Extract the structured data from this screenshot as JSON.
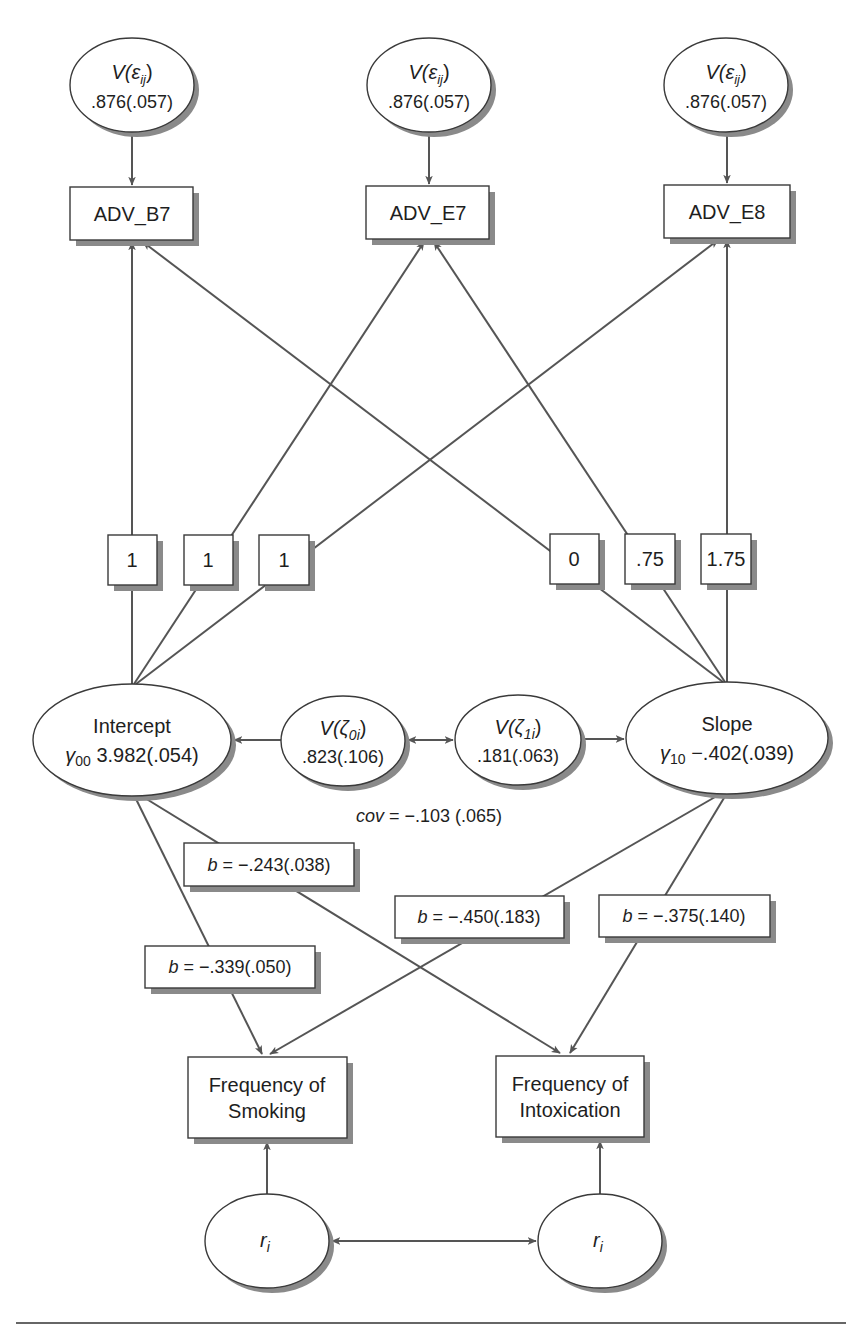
{
  "diagram": {
    "error_variances": [
      {
        "label": "V(ε",
        "sub": "ij",
        "close": ")",
        "value": ".876(.057)"
      },
      {
        "label": "V(ε",
        "sub": "ij",
        "close": ")",
        "value": ".876(.057)"
      },
      {
        "label": "V(ε",
        "sub": "ij",
        "close": ")",
        "value": ".876(.057)"
      }
    ],
    "indicators": [
      "ADV_B7",
      "ADV_E7",
      "ADV_E8"
    ],
    "intercept_loadings": [
      "1",
      "1",
      "1"
    ],
    "slope_loadings": [
      "0",
      ".75",
      "1.75"
    ],
    "intercept": {
      "label": "Intercept",
      "gamma": "γ",
      "gamma_sub": "00",
      "value": "3.982(.054)"
    },
    "slope": {
      "label": "Slope",
      "gamma": "γ",
      "gamma_sub": "10",
      "value": "−.402(.039)"
    },
    "zeta0": {
      "label": "V(ζ",
      "sub": "0i",
      "close": ")",
      "value": ".823(.106)"
    },
    "zeta1": {
      "label": "V(ζ",
      "sub": "1i",
      "close": ")",
      "value": ".181(.063)"
    },
    "covariance": {
      "label": "cov",
      "value": " = −.103 (.065)"
    },
    "paths": [
      {
        "from": "Intercept",
        "to": "Frequency of Intoxication",
        "b": "b",
        "value": " = −.243(.038)"
      },
      {
        "from": "Slope",
        "to": "Frequency of Smoking",
        "b": "b",
        "value": " = −.450(.183)"
      },
      {
        "from": "Slope",
        "to": "Frequency of Intoxication",
        "b": "b",
        "value": " = −.375(.140)"
      },
      {
        "from": "Intercept",
        "to": "Frequency of Smoking",
        "b": "b",
        "value": " = −.339(.050)"
      }
    ],
    "outcomes": [
      {
        "line1": "Frequency of",
        "line2": "Smoking"
      },
      {
        "line1": "Frequency of",
        "line2": "Intoxication"
      }
    ],
    "residuals": [
      {
        "label": "r",
        "sub": "i"
      },
      {
        "label": "r",
        "sub": "i"
      }
    ],
    "colors": {
      "stroke": "#3a3a3a",
      "edge": "#555555",
      "shadow": "#8a8a8a",
      "background": "#ffffff"
    }
  }
}
